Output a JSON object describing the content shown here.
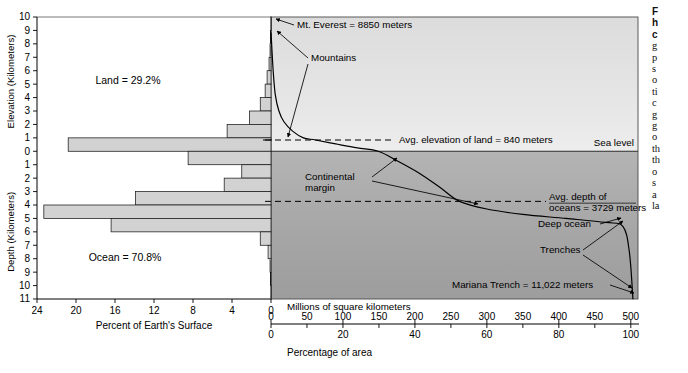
{
  "figure": {
    "land_label": "Land = 29.2%",
    "ocean_label": "Ocean = 70.8%",
    "sea_level_label": "Sea level"
  },
  "axes": {
    "left_y_upper_label": "Elevation (Kilometers)",
    "left_y_lower_label": "Depth (Kilometers)",
    "left_x_label": "Percent of Earth's Surface",
    "left_x_ticks": [
      24,
      20,
      16,
      12,
      8,
      4,
      0
    ],
    "elevation_ticks": [
      10,
      9,
      8,
      7,
      6,
      5,
      4,
      3,
      2,
      1,
      0
    ],
    "depth_ticks": [
      1,
      2,
      3,
      4,
      5,
      6,
      7,
      8,
      9,
      10,
      11
    ],
    "area_axis_label": "Millions of square kilometers",
    "area_ticks": [
      0,
      50,
      100,
      150,
      200,
      250,
      300,
      350,
      400,
      450,
      500
    ],
    "percent_axis_label": "Percentage of area",
    "percent_ticks": [
      0,
      20,
      40,
      60,
      80,
      100
    ]
  },
  "annotations": {
    "everest": "Mt. Everest = 8850 meters",
    "mountains": "Mountains",
    "avg_elevation": "Avg. elevation of land = 840 meters",
    "continental_margin_line1": "Continental",
    "continental_margin_line2": "margin",
    "avg_depth_line1": "Avg. depth of",
    "avg_depth_line2": "oceans = 3729 meters",
    "deep_ocean": "Deep ocean",
    "trenches": "Trenches",
    "mariana": "Mariana Trench = 11,022 meters"
  },
  "caption": {
    "head_lines": [
      "F",
      "h",
      "c"
    ],
    "body_lines": [
      "g",
      "p",
      "s",
      "o",
      "ti",
      "c",
      "g",
      "g",
      "o",
      "th",
      "th",
      "o",
      "s",
      "a",
      "la"
    ]
  },
  "colors": {
    "land_fill": "#e3e3e3",
    "ocean_fill": "#a8a8a8",
    "bar_fill": "#d2d2d2",
    "bar_stroke": "#1a1a1a",
    "axis": "#000000",
    "curve": "#000000"
  },
  "chart_data": {
    "type": "bar",
    "xlabel": "Percent of Earth's Surface",
    "ylabel": "Elevation / Depth (Kilometers)",
    "xlim": [
      0,
      25
    ],
    "ylim": [
      -11,
      10
    ],
    "grid": false,
    "legend": false,
    "histogram": {
      "description": "Percent of Earth's surface in each 1 km elevation/depth interval",
      "bins": [
        {
          "interval": "9 to 10 km",
          "top": 10,
          "bottom": 9,
          "percent": 0.02
        },
        {
          "interval": "8 to 9 km",
          "top": 9,
          "bottom": 8,
          "percent": 0.05
        },
        {
          "interval": "7 to 8 km",
          "top": 8,
          "bottom": 7,
          "percent": 0.1
        },
        {
          "interval": "6 to 7 km",
          "top": 7,
          "bottom": 6,
          "percent": 0.2
        },
        {
          "interval": "5 to 6 km",
          "top": 6,
          "bottom": 5,
          "percent": 0.4
        },
        {
          "interval": "4 to 5 km",
          "top": 5,
          "bottom": 4,
          "percent": 0.6
        },
        {
          "interval": "3 to 4 km",
          "top": 4,
          "bottom": 3,
          "percent": 1.1
        },
        {
          "interval": "2 to 3 km",
          "top": 3,
          "bottom": 2,
          "percent": 2.2
        },
        {
          "interval": "1 to 2 km",
          "top": 2,
          "bottom": 1,
          "percent": 4.5
        },
        {
          "interval": "0 to 1 km",
          "top": 1,
          "bottom": 0,
          "percent": 20.8
        },
        {
          "interval": "0 to -1 km",
          "top": 0,
          "bottom": -1,
          "percent": 8.5
        },
        {
          "interval": "-1 to -2 km",
          "top": -1,
          "bottom": -2,
          "percent": 3.0
        },
        {
          "interval": "-2 to -3 km",
          "top": -2,
          "bottom": -3,
          "percent": 4.8
        },
        {
          "interval": "-3 to -4 km",
          "top": -3,
          "bottom": -4,
          "percent": 13.9
        },
        {
          "interval": "-4 to -5 km",
          "top": -4,
          "bottom": -5,
          "percent": 23.3
        },
        {
          "interval": "-5 to -6 km",
          "top": -5,
          "bottom": -6,
          "percent": 16.4
        },
        {
          "interval": "-6 to -7 km",
          "top": -6,
          "bottom": -7,
          "percent": 1.1
        },
        {
          "interval": "-7 to -8 km",
          "top": -7,
          "bottom": -8,
          "percent": 0.3
        },
        {
          "interval": "-8 to -9 km",
          "top": -8,
          "bottom": -9,
          "percent": 0.1
        },
        {
          "interval": "-9 to -10 km",
          "top": -9,
          "bottom": -10,
          "percent": 0.05
        },
        {
          "interval": "-10 to -11 km",
          "top": -10,
          "bottom": -11,
          "percent": 0.02
        }
      ],
      "land_total_percent": 29.2,
      "ocean_total_percent": 70.8
    },
    "cumulative_curve": {
      "description": "Cumulative area curve: elevation vs cumulative millions of square kilometers",
      "xlabel": "Millions of square kilometers",
      "xlim": [
        0,
        510
      ],
      "points": [
        {
          "area": 0,
          "elevation": 8.85
        },
        {
          "area": 3,
          "elevation": 6.0
        },
        {
          "area": 6,
          "elevation": 4.2
        },
        {
          "area": 11,
          "elevation": 3.0
        },
        {
          "area": 18,
          "elevation": 2.2
        },
        {
          "area": 30,
          "elevation": 1.5
        },
        {
          "area": 45,
          "elevation": 1.0
        },
        {
          "area": 62,
          "elevation": 0.84
        },
        {
          "area": 90,
          "elevation": 0.55
        },
        {
          "area": 120,
          "elevation": 0.25
        },
        {
          "area": 149,
          "elevation": 0.0
        },
        {
          "area": 175,
          "elevation": -0.7
        },
        {
          "area": 205,
          "elevation": -1.6
        },
        {
          "area": 235,
          "elevation": -2.7
        },
        {
          "area": 262,
          "elevation": -3.73
        },
        {
          "area": 300,
          "elevation": -4.3
        },
        {
          "area": 350,
          "elevation": -4.7
        },
        {
          "area": 410,
          "elevation": -5.0
        },
        {
          "area": 465,
          "elevation": -5.3
        },
        {
          "area": 489,
          "elevation": -5.6
        },
        {
          "area": 498,
          "elevation": -7.5
        },
        {
          "area": 503,
          "elevation": -11.02
        }
      ],
      "avg_elevation_of_land_m": 840,
      "avg_depth_of_oceans_m": 3729,
      "max_elevation_m": 8850,
      "max_depth_m": 11022
    }
  }
}
